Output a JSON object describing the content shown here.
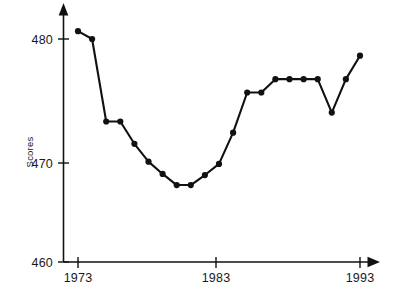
{
  "chart_data": {
    "type": "line",
    "title": "",
    "xlabel": "",
    "ylabel": "Scores",
    "xlim": [
      1973,
      1994
    ],
    "ylim": [
      460,
      482
    ],
    "grid": false,
    "legend": null,
    "x_ticks": [
      "1973",
      "1983",
      "1993"
    ],
    "x_tick_values": [
      1973,
      1983,
      1993
    ],
    "y_ticks": [
      "460",
      "470",
      "480"
    ],
    "y_tick_values": [
      460,
      470,
      480
    ],
    "x": [
      1973,
      1974,
      1975,
      1976,
      1977,
      1978,
      1979,
      1980,
      1981,
      1982,
      1983,
      1984,
      1985,
      1986,
      1987,
      1988,
      1989,
      1990,
      1991,
      1992,
      1993
    ],
    "values": [
      480.7,
      480.0,
      472.6,
      472.6,
      470.6,
      469.0,
      467.9,
      466.9,
      466.9,
      467.8,
      468.8,
      471.6,
      475.2,
      475.2,
      476.4,
      476.4,
      476.4,
      476.4,
      473.4,
      476.4,
      478.5
    ],
    "series": [
      {
        "name": "Scores",
        "values": [
          480.7,
          480.0,
          472.6,
          472.6,
          470.6,
          469.0,
          467.9,
          466.9,
          466.9,
          467.8,
          468.8,
          471.6,
          475.2,
          475.2,
          476.4,
          476.4,
          476.4,
          476.4,
          473.4,
          476.4,
          478.5
        ]
      }
    ],
    "marker": "filled-circle",
    "line_color": "#111111",
    "marker_color": "#111111",
    "axis_color": "#111111",
    "background_color": "#ffffff",
    "x_axis_arrow": true,
    "y_axis_arrow": true
  },
  "labels": {
    "y_axis_title": "Scores",
    "y_tick_480": "480",
    "y_tick_470": "470",
    "y_tick_460": "460",
    "x_tick_1973": "1973",
    "x_tick_1983": "1983",
    "x_tick_1993": "1993"
  }
}
